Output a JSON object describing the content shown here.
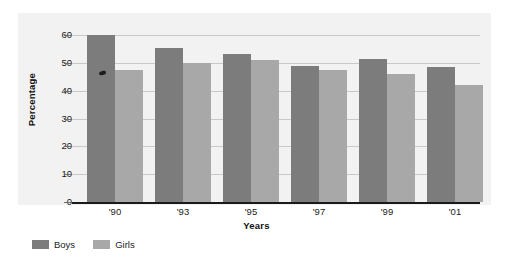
{
  "chart_data": {
    "type": "bar",
    "title": "",
    "xlabel": "Years",
    "ylabel": "Percentage",
    "categories": [
      "'90",
      "'93",
      "'95",
      "'97",
      "'99",
      "'01"
    ],
    "series": [
      {
        "name": "Boys",
        "color": "#7c7c7c",
        "values": [
          60,
          55.5,
          53,
          49,
          51.5,
          48.5
        ]
      },
      {
        "name": "Girls",
        "color": "#a8a8a8",
        "values": [
          47.5,
          50,
          51,
          47.5,
          46,
          42
        ]
      }
    ],
    "ylim": [
      0,
      60
    ],
    "yticks": [
      0,
      10,
      20,
      30,
      40,
      50,
      60
    ],
    "ytick_labels": [
      "0",
      "10",
      "20",
      "30",
      "40",
      "50",
      "60"
    ],
    "grid": true,
    "legend_position": "bottom-left"
  },
  "legend": {
    "items": [
      {
        "label": "Boys",
        "color": "#7c7c7c"
      },
      {
        "label": "Girls",
        "color": "#a8a8a8"
      }
    ]
  },
  "colors": {
    "panel_background": "#f2f2f2",
    "gridline": "#c9c9c9",
    "axis": "#1a1a1a",
    "boys": "#7c7c7c",
    "girls": "#a8a8a8"
  }
}
